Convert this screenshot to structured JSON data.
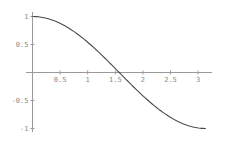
{
  "chart_data": {
    "type": "line",
    "title": "",
    "xlabel": "",
    "ylabel": "",
    "function": "cos(x)",
    "xlim": [
      0,
      3.14159
    ],
    "ylim": [
      -1,
      1
    ],
    "grid": false,
    "legend": null,
    "x_ticks": [
      0.5,
      1,
      1.5,
      2,
      2.5,
      3
    ],
    "x_tick_labels": [
      "0.5",
      "1",
      "1.5",
      "2",
      "2.5",
      "3"
    ],
    "y_ticks": [
      -1,
      -0.5,
      0.5,
      1
    ],
    "y_tick_labels": [
      "-1",
      "-0.5",
      "0.5",
      "1"
    ],
    "series": [
      {
        "name": "cos(x)",
        "x": [
          0,
          0.25,
          0.5,
          0.75,
          1.0,
          1.25,
          1.5,
          1.5708,
          1.75,
          2.0,
          2.25,
          2.5,
          2.75,
          3.0,
          3.1416
        ],
        "values": [
          1.0,
          0.969,
          0.878,
          0.732,
          0.54,
          0.315,
          0.071,
          0.0,
          -0.178,
          -0.416,
          -0.628,
          -0.801,
          -0.924,
          -0.99,
          -1.0
        ]
      }
    ],
    "colors": {
      "curve": "#4a4a4a",
      "axis": "#9a9a9a",
      "labels": "#8a8a8a"
    }
  }
}
